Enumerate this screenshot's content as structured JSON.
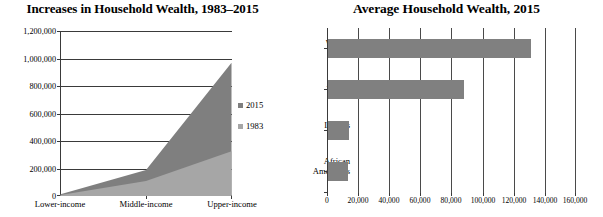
{
  "chart_data": [
    {
      "type": "area",
      "title": "Increases in Household Wealth, 1983–2015",
      "xlabel": "",
      "ylabel": "",
      "categories": [
        "Lower-income",
        "Middle-income",
        "Upper-income"
      ],
      "series": [
        {
          "name": "2015",
          "values": [
            12000,
            190000,
            970000
          ],
          "color": "#7f7f7f"
        },
        {
          "name": "1983",
          "values": [
            8000,
            110000,
            325000
          ],
          "color": "#a6a6a6"
        }
      ],
      "ylim": [
        0,
        1200000
      ],
      "yticks": [
        0,
        200000,
        400000,
        600000,
        800000,
        1000000,
        1200000
      ],
      "ytick_labels": [
        "0",
        "200,000",
        "400,000",
        "600,000",
        "800,000",
        "1,000,000",
        "1,200,000"
      ],
      "grid": true,
      "legend": {
        "position": "right",
        "entries": [
          "2015",
          "1983"
        ]
      }
    },
    {
      "type": "bar",
      "orientation": "horizontal",
      "title": "Average Household Wealth, 2015",
      "xlabel": "",
      "ylabel": "",
      "categories": [
        "Whites",
        "Asians",
        "Latinos",
        "African Americans"
      ],
      "category_lines": [
        [
          "Whites"
        ],
        [
          "Asians"
        ],
        [
          "Latinos"
        ],
        [
          "African",
          "Americans"
        ]
      ],
      "values": [
        131000,
        88000,
        13500,
        13000
      ],
      "bar_color": "#808080",
      "xlim": [
        0,
        160000
      ],
      "xticks": [
        0,
        20000,
        40000,
        60000,
        80000,
        100000,
        120000,
        140000,
        160000
      ],
      "xtick_labels": [
        "0",
        "20,000",
        "40,000",
        "60,000",
        "80,000",
        "100,000",
        "120,000",
        "140,000",
        "160,000"
      ],
      "grid": true,
      "legend": {
        "position": "none",
        "entries": []
      }
    }
  ],
  "left_chart": {
    "title": "Increases in Household Wealth, 1983–2015",
    "y_axis": {
      "tick_labels": [
        "1,200,000",
        "1,000,000",
        "800,000",
        "600,000",
        "400,000",
        "200,000",
        "0"
      ]
    },
    "x_axis": {
      "tick_labels": [
        "Lower-income",
        "Middle-income",
        "Upper-income"
      ]
    },
    "legend": {
      "items": [
        {
          "label": "2015",
          "color": "#7f7f7f"
        },
        {
          "label": "1983",
          "color": "#a6a6a6"
        }
      ]
    }
  },
  "right_chart": {
    "title": "Average Household Wealth, 2015",
    "y_axis": {
      "tick_labels": [
        "Whites",
        "Asians",
        "Latinos",
        "African Americans"
      ]
    },
    "x_axis": {
      "tick_labels": [
        "0",
        "20,000",
        "40,000",
        "60,000",
        "80,000",
        "100,000",
        "120,000",
        "140,000",
        "160,000"
      ]
    }
  },
  "colors": {
    "series_2015": "#7f7f7f",
    "series_1983": "#a6a6a6",
    "bar": "#808080",
    "axis": "#3a3a3a",
    "background": "#ffffff"
  }
}
